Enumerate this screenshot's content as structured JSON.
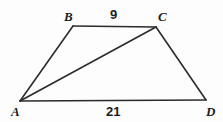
{
  "figure": {
    "type": "geometry-diagram",
    "shape_name": "trapezoid ABCD with diagonal AC",
    "background_color": "#fdfdfd",
    "stroke_color": "#2b2b2b",
    "stroke_width": 1.6,
    "width": 223,
    "height": 122,
    "vertices": [
      {
        "id": "A",
        "label": "A",
        "x": 20,
        "y": 101,
        "label_x": 11,
        "label_y": 105
      },
      {
        "id": "B",
        "label": "B",
        "x": 73,
        "y": 26,
        "label_x": 64,
        "label_y": 10
      },
      {
        "id": "C",
        "label": "C",
        "x": 156,
        "y": 27,
        "label_x": 158,
        "label_y": 10
      },
      {
        "id": "D",
        "label": "D",
        "x": 206,
        "y": 100,
        "label_x": 206,
        "label_y": 105
      }
    ],
    "edges": [
      {
        "id": "AB",
        "from": "A",
        "to": "B"
      },
      {
        "id": "BC",
        "from": "B",
        "to": "C"
      },
      {
        "id": "CD",
        "from": "C",
        "to": "D"
      },
      {
        "id": "AD",
        "from": "A",
        "to": "D"
      },
      {
        "id": "AC",
        "from": "A",
        "to": "C",
        "role": "diagonal"
      }
    ],
    "measures": [
      {
        "id": "BC",
        "edge": "BC",
        "value": "9",
        "x": 115,
        "y": 10
      },
      {
        "id": "AD",
        "edge": "AD",
        "value": "21",
        "x": 113,
        "y": 105
      }
    ]
  }
}
